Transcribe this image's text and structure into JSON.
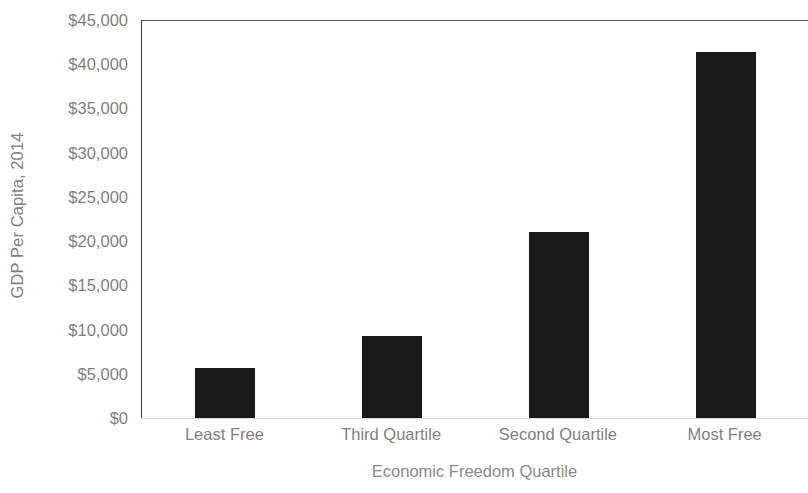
{
  "chart_data": {
    "type": "bar",
    "title": "",
    "subtitle": "",
    "xlabel": "Economic Freedom Quartile",
    "ylabel": "GDP Per Capita, 2014",
    "categories": [
      "Least Free",
      "Third Quartile",
      "Second Quartile",
      "Most Free"
    ],
    "values": [
      5600,
      9300,
      21000,
      41400
    ],
    "ylim": [
      0,
      45000
    ],
    "ytick_step": 5000,
    "ytick_labels": [
      "$0",
      "$5,000",
      "$10,000",
      "$15,000",
      "$20,000",
      "$25,000",
      "$30,000",
      "$35,000",
      "$40,000",
      "$45,000"
    ],
    "ytick_values": [
      0,
      5000,
      10000,
      15000,
      20000,
      25000,
      30000,
      35000,
      40000,
      45000
    ],
    "grid": false,
    "legend": false,
    "legend_position": "none",
    "bar_color": "#1a1a1a",
    "axis_color": "#3c3c3c",
    "label_color": "#7f7f7f",
    "background_color": "#ffffff"
  }
}
